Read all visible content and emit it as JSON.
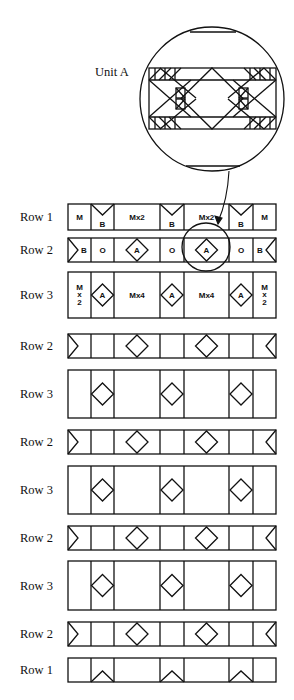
{
  "diagram": {
    "unit_label": "Unit A",
    "rows": [
      {
        "label": "Row 1",
        "type": "row1-labeled",
        "top": 204,
        "height": 26,
        "cells": [
          "M",
          "B",
          "Mx2",
          "B",
          "Mx2",
          "B",
          "M"
        ]
      },
      {
        "label": "Row 2",
        "type": "row2-labeled",
        "top": 238,
        "height": 24,
        "cells": [
          "B",
          "O",
          "A",
          "O",
          "A",
          "O",
          "B"
        ]
      },
      {
        "label": "Row 3",
        "type": "row3-labeled",
        "top": 272,
        "height": 46,
        "cells": [
          "M x 2",
          "A",
          "Mx4",
          "A",
          "Mx4",
          "A",
          "M x 2"
        ]
      },
      {
        "label": "Row 2",
        "type": "row2",
        "top": 334,
        "height": 24
      },
      {
        "label": "Row 3",
        "type": "row3",
        "top": 370,
        "height": 48
      },
      {
        "label": "Row 2",
        "type": "row2",
        "top": 430,
        "height": 24
      },
      {
        "label": "Row 3",
        "type": "row3",
        "top": 466,
        "height": 48
      },
      {
        "label": "Row 2",
        "type": "row2",
        "top": 526,
        "height": 24
      },
      {
        "label": "Row 3",
        "type": "row3",
        "top": 561,
        "height": 49
      },
      {
        "label": "Row 2",
        "type": "row2",
        "top": 622,
        "height": 24
      },
      {
        "label": "Row 1",
        "type": "row1",
        "top": 658,
        "height": 24
      }
    ],
    "columns_x": [
      68,
      91,
      114,
      160,
      184,
      229,
      253,
      276
    ],
    "line_color": "#111111",
    "background": "#ffffff"
  }
}
